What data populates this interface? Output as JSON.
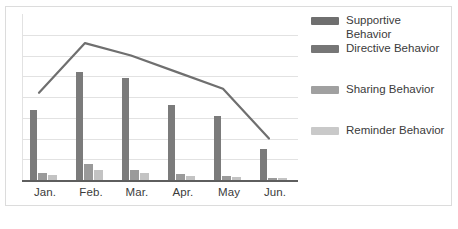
{
  "chart_data": {
    "type": "bar",
    "title": "",
    "subtitle": "",
    "xlabel": "",
    "ylabel": "",
    "categories": [
      "Jan.",
      "Feb.",
      "Mar.",
      "Apr.",
      "May",
      "Jun."
    ],
    "ylim": [
      0,
      8
    ],
    "grid": true,
    "gridlines": [
      1,
      2,
      3,
      4,
      5,
      6,
      7
    ],
    "legend_position": "right",
    "series": [
      {
        "name": "Supportive Behavior",
        "render": "line",
        "color": "#6f6f6f",
        "values": [
          4.2,
          6.6,
          6.0,
          5.2,
          4.4,
          2.0
        ]
      },
      {
        "name": "Directive Behavior",
        "render": "bar",
        "color": "#7b7b7b",
        "values": [
          3.4,
          5.2,
          4.9,
          3.6,
          3.1,
          1.5
        ]
      },
      {
        "name": "Sharing Behavior",
        "render": "bar",
        "color": "#9a9a9a",
        "values": [
          0.35,
          0.75,
          0.5,
          0.3,
          0.2,
          0.12
        ]
      },
      {
        "name": "Reminder Behavior",
        "render": "bar",
        "color": "#c3c3c3",
        "values": [
          0.25,
          0.5,
          0.35,
          0.2,
          0.15,
          0.08
        ]
      }
    ]
  },
  "legend": {
    "items": [
      {
        "label_line1": "Supportive",
        "label_line2": "Behavior",
        "color": "#6f6f6f"
      },
      {
        "label_line1": "Directive Behavior",
        "label_line2": "",
        "color": "#767676"
      },
      {
        "label_line1": "Sharing Behavior",
        "label_line2": "",
        "color": "#a0a0a0"
      },
      {
        "label_line1": "Reminder Behavior",
        "label_line2": "",
        "color": "#c9c9c9"
      }
    ]
  },
  "axis": {
    "tick_labels": [
      "Jan.",
      "Feb.",
      "Mar.",
      "Apr.",
      "May",
      "Jun."
    ]
  },
  "colors": {
    "grid": "#e2e2e2",
    "baseline": "#5e5e5e",
    "frame": "#dcdcdc",
    "text": "#3b3b3b",
    "background": "#ffffff"
  }
}
